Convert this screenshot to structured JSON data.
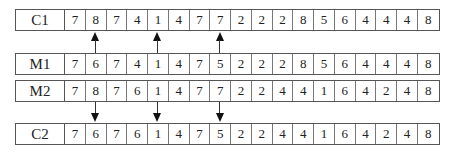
{
  "diagram": {
    "rows": [
      {
        "label": "C1",
        "values": [
          "7",
          "8",
          "7",
          "4",
          "1",
          "4",
          "7",
          "7",
          "2",
          "2",
          "2",
          "8",
          "5",
          "6",
          "4",
          "4",
          "4",
          "8"
        ]
      },
      {
        "label": "M1",
        "values": [
          "7",
          "6",
          "7",
          "4",
          "1",
          "4",
          "7",
          "5",
          "2",
          "2",
          "2",
          "8",
          "5",
          "6",
          "4",
          "4",
          "4",
          "8"
        ]
      },
      {
        "label": "M2",
        "values": [
          "7",
          "8",
          "7",
          "6",
          "1",
          "4",
          "7",
          "7",
          "2",
          "2",
          "4",
          "4",
          "1",
          "6",
          "4",
          "2",
          "4",
          "8"
        ]
      },
      {
        "label": "C2",
        "values": [
          "7",
          "6",
          "7",
          "6",
          "1",
          "4",
          "7",
          "5",
          "2",
          "2",
          "4",
          "4",
          "1",
          "6",
          "4",
          "2",
          "4",
          "8"
        ]
      }
    ],
    "arrows_up": {
      "from": "M1",
      "to": "C1",
      "positions": [
        2,
        5,
        8
      ]
    },
    "arrows_down": {
      "from": "M2",
      "to": "C2",
      "positions": [
        2,
        5,
        8
      ]
    }
  }
}
